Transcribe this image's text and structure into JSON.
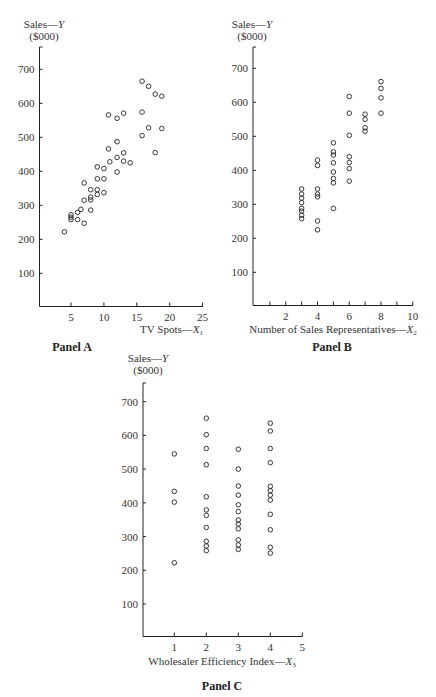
{
  "chart_data": [
    {
      "type": "scatter",
      "title": "Panel A",
      "xlabel": "TV Spots—X1",
      "xlabel_main": "TV Spots—",
      "xlabel_var": "X",
      "xlabel_sub": "1",
      "ylabel": "Sales—Y ($000)",
      "ylabel_line1": "Sales—",
      "ylabel_var": "Y",
      "ylabel_line2": "($000)",
      "xlim": [
        0,
        25
      ],
      "ylim": [
        0,
        750
      ],
      "xticks": [
        5,
        10,
        15,
        20,
        25
      ],
      "yticks": [
        100,
        200,
        300,
        400,
        500,
        600,
        700
      ],
      "grid": false,
      "points": [
        [
          4.0,
          222
        ],
        [
          5,
          272
        ],
        [
          5,
          265
        ],
        [
          5,
          258
        ],
        [
          6,
          279
        ],
        [
          6,
          258
        ],
        [
          6.5,
          288
        ],
        [
          7,
          247
        ],
        [
          7,
          315
        ],
        [
          7,
          366
        ],
        [
          8,
          346
        ],
        [
          8,
          324
        ],
        [
          8,
          316
        ],
        [
          8,
          286
        ],
        [
          9,
          346
        ],
        [
          9,
          332
        ],
        [
          9,
          378
        ],
        [
          9,
          413
        ],
        [
          10,
          378
        ],
        [
          10,
          408
        ],
        [
          10,
          337
        ],
        [
          10.7,
          466
        ],
        [
          10.7,
          566
        ],
        [
          10.9,
          428
        ],
        [
          12,
          556
        ],
        [
          12,
          487
        ],
        [
          12,
          441
        ],
        [
          12,
          398
        ],
        [
          13,
          571
        ],
        [
          13,
          454
        ],
        [
          13,
          430
        ],
        [
          14,
          425
        ],
        [
          15.8,
          665
        ],
        [
          15.8,
          574
        ],
        [
          15.8,
          505
        ],
        [
          16.8,
          650
        ],
        [
          16.8,
          528
        ],
        [
          17.8,
          627
        ],
        [
          17.8,
          455
        ],
        [
          18.8,
          621
        ],
        [
          18.8,
          526
        ]
      ]
    },
    {
      "type": "scatter",
      "title": "Panel B",
      "xlabel": "Number of Sales Representatives—X2",
      "xlabel_main": "Number of Sales Representatives—",
      "xlabel_var": "X",
      "xlabel_sub": "2",
      "ylabel": "Sales—Y ($000)",
      "ylabel_line1": "Sales—",
      "ylabel_var": "Y",
      "ylabel_line2": "($000)",
      "xlim": [
        0,
        10
      ],
      "ylim": [
        0,
        750
      ],
      "xticks": [
        2,
        4,
        6,
        8,
        10
      ],
      "xminor": [
        1,
        3,
        5,
        7,
        9
      ],
      "yticks": [
        100,
        200,
        300,
        400,
        500,
        600,
        700
      ],
      "grid": false,
      "points": [
        [
          3,
          345
        ],
        [
          3,
          330
        ],
        [
          3,
          318
        ],
        [
          3,
          305
        ],
        [
          3,
          288
        ],
        [
          3,
          280
        ],
        [
          3,
          268
        ],
        [
          3,
          258
        ],
        [
          4,
          430
        ],
        [
          4,
          414
        ],
        [
          4,
          345
        ],
        [
          4,
          330
        ],
        [
          4,
          322
        ],
        [
          4,
          251
        ],
        [
          4,
          225
        ],
        [
          5,
          481
        ],
        [
          5,
          454
        ],
        [
          5,
          445
        ],
        [
          5,
          422
        ],
        [
          5,
          395
        ],
        [
          5,
          376
        ],
        [
          5,
          363
        ],
        [
          5,
          288
        ],
        [
          6,
          617
        ],
        [
          6,
          568
        ],
        [
          6,
          503
        ],
        [
          6,
          440
        ],
        [
          6,
          423
        ],
        [
          6,
          405
        ],
        [
          6,
          368
        ],
        [
          7,
          565
        ],
        [
          7,
          550
        ],
        [
          7,
          525
        ],
        [
          7,
          515
        ],
        [
          8,
          661
        ],
        [
          8,
          641
        ],
        [
          8,
          613
        ],
        [
          8,
          568
        ]
      ]
    },
    {
      "type": "scatter",
      "title": "Panel C",
      "xlabel": "Wholesaler Efficiency Index—X3",
      "xlabel_main": "Wholesaler Efficiency Index—",
      "xlabel_var": "X",
      "xlabel_sub": "3",
      "ylabel": "Sales—Y ($000)",
      "ylabel_line1": "Sales—",
      "ylabel_var": "Y",
      "ylabel_line2": "($000)",
      "xlim": [
        0,
        5
      ],
      "ylim": [
        0,
        750
      ],
      "xticks": [
        1,
        2,
        3,
        4,
        5
      ],
      "yticks": [
        100,
        200,
        300,
        400,
        500,
        600,
        700
      ],
      "grid": false,
      "points": [
        [
          1,
          545
        ],
        [
          1,
          434
        ],
        [
          1,
          402
        ],
        [
          1,
          222
        ],
        [
          2,
          651
        ],
        [
          2,
          602
        ],
        [
          2,
          561
        ],
        [
          2,
          513
        ],
        [
          2,
          418
        ],
        [
          2,
          379
        ],
        [
          2,
          363
        ],
        [
          2,
          327
        ],
        [
          2,
          286
        ],
        [
          2,
          272
        ],
        [
          2,
          258
        ],
        [
          3,
          559
        ],
        [
          3,
          500
        ],
        [
          3,
          450
        ],
        [
          3,
          423
        ],
        [
          3,
          394
        ],
        [
          3,
          374
        ],
        [
          3,
          349
        ],
        [
          3,
          337
        ],
        [
          3,
          323
        ],
        [
          3,
          290
        ],
        [
          3,
          275
        ],
        [
          3,
          262
        ],
        [
          4,
          636
        ],
        [
          4,
          613
        ],
        [
          4,
          561
        ],
        [
          4,
          519
        ],
        [
          4,
          449
        ],
        [
          4,
          436
        ],
        [
          4,
          423
        ],
        [
          4,
          408
        ],
        [
          4,
          366
        ],
        [
          4,
          320
        ],
        [
          4,
          268
        ],
        [
          4,
          251
        ]
      ]
    }
  ],
  "layout": [
    {
      "axisX": 39.5,
      "axisTop": 47,
      "baseY": 306.5,
      "axisRight": 203,
      "x0": 38.1,
      "xs": 6.58,
      "y0": 307.3,
      "ys": 0.34,
      "titleX": 72,
      "titleY": 351,
      "xlabX": 203,
      "xlabY": 333,
      "xlabAnchor": "end",
      "ylabX": 44,
      "ylabY": 28
    },
    {
      "axisX": 253,
      "axisTop": 47,
      "baseY": 305.5,
      "axisRight": 413,
      "x0": 254,
      "xs": 15.875,
      "y0": 306.3,
      "ys": 0.34,
      "titleX": 332,
      "titleY": 351,
      "xlabX": 333,
      "xlabY": 333,
      "xlabAnchor": "middle",
      "ylabX": 252,
      "ylabY": 28
    },
    {
      "axisX": 143,
      "axisTop": 383,
      "baseY": 636.5,
      "axisRight": 302.5,
      "x0": 142.3,
      "xs": 32,
      "y0": 637.7,
      "ys": 0.3372,
      "titleX": 222,
      "titleY": 690,
      "xlabX": 222,
      "xlabY": 665,
      "xlabAnchor": "middle",
      "ylabX": 148,
      "ylabY": 362
    }
  ]
}
